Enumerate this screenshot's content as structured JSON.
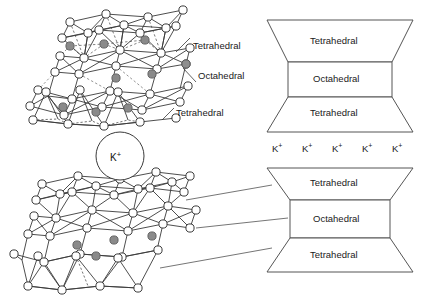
{
  "figure": {
    "background_color": "#ffffff",
    "line_color": "#3a3a3a",
    "atom_fill_open": "#ffffff",
    "atom_fill_shaded": "#8a8a8a"
  },
  "structure_labels": {
    "upper_tetrahedral_top": "Tetrahedral",
    "upper_octahedral": "Octahedral",
    "upper_tetrahedral_bottom": "Tetrahedral"
  },
  "interlayer": {
    "cation_label": "K",
    "cation_charge": "+"
  },
  "block_upper": {
    "layers": [
      {
        "name": "tetrahedral-top",
        "label": "Tetrahedral",
        "shape": "trapezoid-down"
      },
      {
        "name": "octahedral",
        "label": "Octahedral",
        "shape": "rectangle"
      },
      {
        "name": "tetrahedral-bottom",
        "label": "Tetrahedral",
        "shape": "trapezoid-up"
      }
    ]
  },
  "block_lower": {
    "layers": [
      {
        "name": "tetrahedral-top",
        "label": "Tetrahedral",
        "shape": "trapezoid-down"
      },
      {
        "name": "octahedral",
        "label": "Octahedral",
        "shape": "rectangle"
      },
      {
        "name": "tetrahedral-bottom",
        "label": "Tetrahedral",
        "shape": "trapezoid-up"
      }
    ]
  },
  "interlayer_row": {
    "ions": [
      {
        "symbol": "K",
        "charge": "+"
      },
      {
        "symbol": "K",
        "charge": "+"
      },
      {
        "symbol": "K",
        "charge": "+"
      },
      {
        "symbol": "K",
        "charge": "+"
      },
      {
        "symbol": "K",
        "charge": "+"
      }
    ]
  }
}
